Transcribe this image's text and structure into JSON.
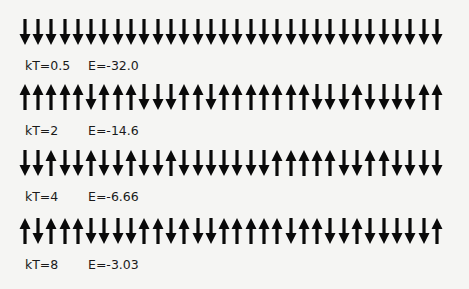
{
  "rows": [
    {
      "kT_label": "kT=0.5",
      "E_label": "E=-32.0",
      "spins": "DDDDDDDDDDDDDDDDDDDDDDDDDDDDDDDD"
    },
    {
      "kT_label": "kT=2",
      "E_label": "E=-14.6",
      "spins": "UUUUUDUUUDDDUUDUUUUUUUDDDUDDDDUU"
    },
    {
      "kT_label": "kT=4",
      "E_label": "E=-6.66",
      "spins": "DDUDDUDDUDDUDDDDDDDUUUUUDDUUDDDD"
    },
    {
      "kT_label": "kT=8",
      "E_label": "E=-3.03",
      "spins": "UDUUUDDDDUUDUDDUUUUUDUUDDUDDDDDU"
    }
  ],
  "colors": {
    "arrow": "#0a0a0a",
    "background": "#f5f5f3",
    "text": "#1a1a1a"
  },
  "legend": {
    "U": "spin-up-arrow",
    "D": "spin-down-arrow"
  }
}
